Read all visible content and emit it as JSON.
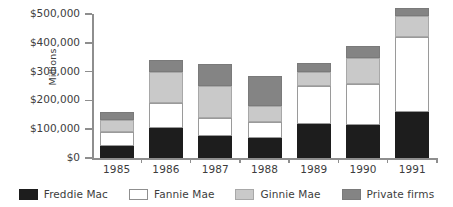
{
  "chart_data": {
    "type": "bar",
    "stacked": true,
    "title": "",
    "subtitle": "",
    "xlabel": "",
    "ylabel": "Millions",
    "ylim": [
      0,
      500000
    ],
    "ytick_values": [
      0,
      100000,
      200000,
      300000,
      400000,
      500000
    ],
    "ytick_labels": [
      "$0",
      "$100,000",
      "$200,000",
      "$300,000",
      "$400,000",
      "$500,000"
    ],
    "grid": false,
    "legend_position": "bottom",
    "categories": [
      "1985",
      "1986",
      "1987",
      "1988",
      "1989",
      "1990",
      "1991"
    ],
    "series": [
      {
        "name": "Freddie Mac",
        "color": "#1d1d1d",
        "values": [
          43000,
          105000,
          75000,
          70000,
          118000,
          115000,
          160000
        ]
      },
      {
        "name": "Fannie Mae",
        "color": "#ffffff",
        "values": [
          47000,
          87000,
          65000,
          55000,
          132000,
          143000,
          260000
        ]
      },
      {
        "name": "Ginnie Mae",
        "color": "#c9c9c9",
        "values": [
          43000,
          105000,
          110000,
          55000,
          48000,
          90000,
          72000
        ]
      },
      {
        "name": "Private firms",
        "color": "#848484",
        "values": [
          25000,
          43000,
          75000,
          105000,
          32000,
          42000,
          28000
        ]
      }
    ],
    "totals": [
      158000,
      340000,
      325000,
      285000,
      330000,
      390000,
      520000
    ]
  }
}
